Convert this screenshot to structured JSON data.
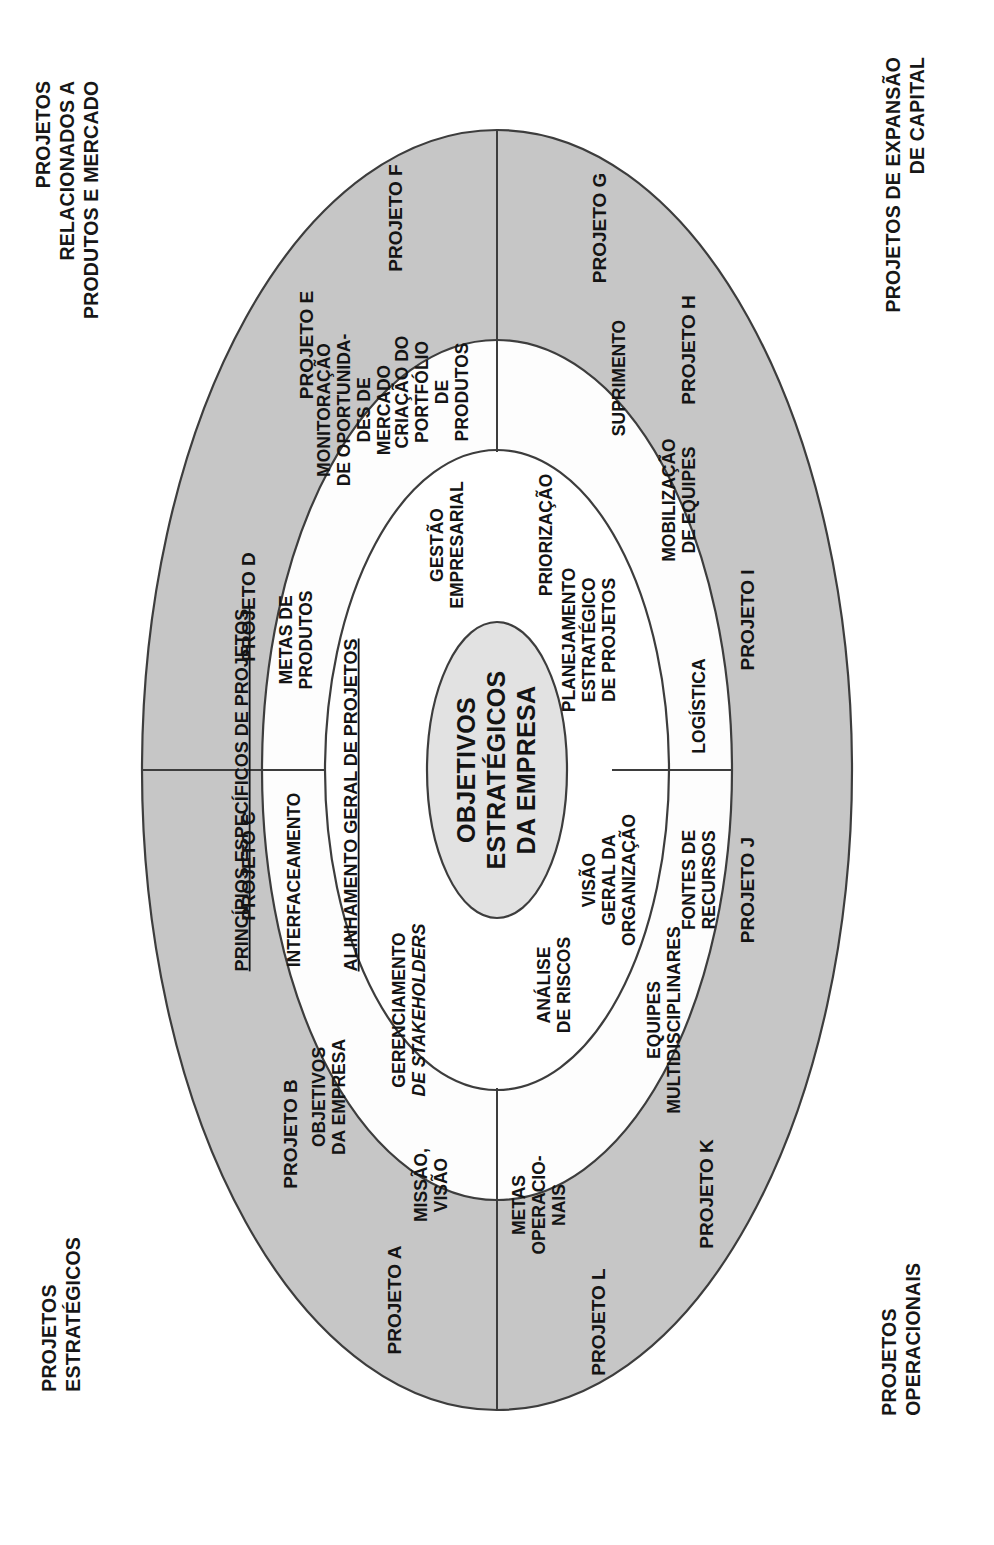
{
  "diagram": {
    "title_visible": false,
    "type": "concentric-ellipse-onion",
    "orientation_note": "rotated-90-ccw",
    "colors": {
      "outer_ring_fill": "#c6c6c6",
      "middle_ring_fill": "#ffffff",
      "inner_ring_fill": "#e4e4e4",
      "core_fill": "#e0e0e0",
      "stroke": "#3d3d3d",
      "text": "#141414",
      "background": "#ffffff"
    }
  },
  "corner_labels": {
    "top_left": "PROJETOS RELACIONADOS A\nPRODUTOS E MERCADO",
    "top_right": "PROJETOS DE EXPANSÃO\nDE CAPITAL",
    "bottom_left": "PROJETOS ESTRATÉGICOS",
    "bottom_right": "PROJETOS OPERACIONAIS"
  },
  "core": {
    "lines": [
      "OBJETIVOS",
      "ESTRATÉGICOS",
      "DA EMPRESA"
    ]
  },
  "band_headings": [
    {
      "id": "alinhamento",
      "text": "ALINHAMENTO GERAL DE PROJETOS",
      "underlined": true
    },
    {
      "id": "principios",
      "text": "PRINCÍPIOS ESPECÍFICOS DE PROJETOS",
      "underlined": true
    }
  ],
  "inner_ring": {
    "name": "anel-interno",
    "items": [
      {
        "id": "gestao-empresarial",
        "lines": [
          "GESTÃO",
          "EMPRESARIAL"
        ],
        "quadrant": "top-left"
      },
      {
        "id": "priorizacao",
        "lines": [
          "PRIORIZAÇÃO"
        ],
        "quadrant": "top-right"
      },
      {
        "id": "planejamento-estrategico",
        "lines": [
          "PLANEJAMENTO",
          "ESTRATÉGICO",
          "DE PROJETOS"
        ],
        "quadrant": "top-right"
      },
      {
        "id": "visao-geral-organizacao",
        "lines": [
          "VISÃO",
          "GERAL DA",
          "ORGANIZAÇÃO"
        ],
        "quadrant": "bottom-right"
      },
      {
        "id": "analise-de-riscos",
        "lines": [
          "ANÁLISE",
          "DE RISCOS"
        ],
        "quadrant": "bottom-left"
      },
      {
        "id": "gerenciamento-stakeholders",
        "lines": [
          "GERENCIAMENTO",
          "DE STAKEHOLDERS"
        ],
        "italic_line": 1,
        "quadrant": "left"
      }
    ]
  },
  "middle_ring": {
    "name": "anel-medio",
    "items": [
      {
        "id": "objetivos-da-empresa",
        "lines": [
          "OBJETIVOS",
          "DA EMPRESA"
        ]
      },
      {
        "id": "interfaceamento",
        "lines": [
          "INTERFACEAMENTO"
        ]
      },
      {
        "id": "metas-de-produtos",
        "lines": [
          "METAS DE",
          "PRODUTOS"
        ]
      },
      {
        "id": "monitoracao-oportunidades-mercado",
        "lines": [
          "MONITORAÇÃO",
          "DE OPORTUNIDA-",
          "DES DE",
          "MERCADO"
        ]
      },
      {
        "id": "criacao-portfolio-produtos",
        "lines": [
          "CRIAÇÃO DO",
          "PORTFÓLIO",
          "DE",
          "PRODUTOS"
        ]
      },
      {
        "id": "suprimento",
        "lines": [
          "SUPRIMENTO"
        ]
      },
      {
        "id": "mobilizacao-de-equipes",
        "lines": [
          "MOBILIZAÇÃO",
          "DE EQUIPES"
        ]
      },
      {
        "id": "logistica",
        "lines": [
          "LOGÍSTICA"
        ]
      },
      {
        "id": "fontes-de-recursos",
        "lines": [
          "FONTES DE",
          "RECURSOS"
        ]
      },
      {
        "id": "equipes-multidisciplinares",
        "lines": [
          "EQUIPES",
          "MULTIDISCIPLINARES"
        ]
      },
      {
        "id": "metas-operacionais",
        "lines": [
          "METAS",
          "OPERACIO-",
          "NAIS"
        ]
      },
      {
        "id": "missao-visao",
        "lines": [
          "MISSÃO,",
          "VISÃO"
        ]
      }
    ]
  },
  "outer_ring": {
    "name": "anel-externo-projetos",
    "items": [
      {
        "id": "projeto-a",
        "label": "PROJETO A"
      },
      {
        "id": "projeto-b",
        "label": "PROJETO B"
      },
      {
        "id": "projeto-c",
        "label": "PROJETO C"
      },
      {
        "id": "projeto-d",
        "label": "PROJETO D"
      },
      {
        "id": "projeto-e",
        "label": "PROJETO E"
      },
      {
        "id": "projeto-f",
        "label": "PROJETO F"
      },
      {
        "id": "projeto-g",
        "label": "PROJETO G"
      },
      {
        "id": "projeto-h",
        "label": "PROJETO H"
      },
      {
        "id": "projeto-i",
        "label": "PROJETO I"
      },
      {
        "id": "projeto-j",
        "label": "PROJETO J"
      },
      {
        "id": "projeto-k",
        "label": "PROJETO K"
      },
      {
        "id": "projeto-l",
        "label": "PROJETO L"
      }
    ]
  }
}
